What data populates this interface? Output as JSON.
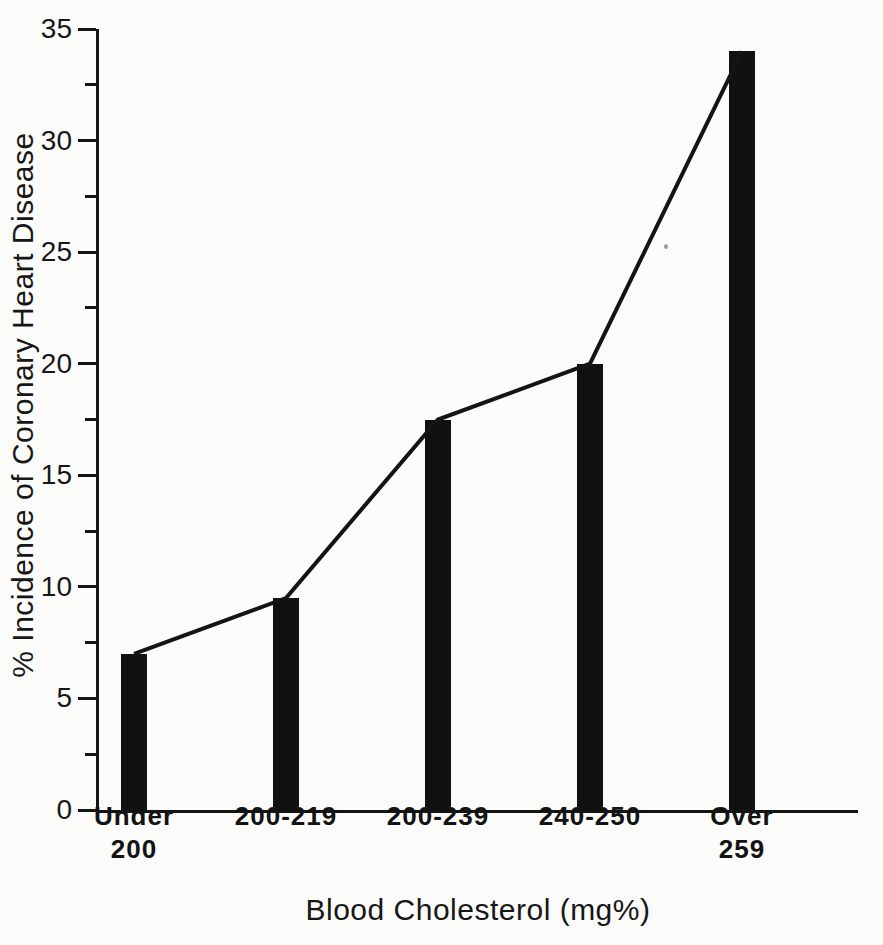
{
  "chart_data": {
    "type": "bar",
    "title": "",
    "subtitle": "",
    "xlabel": "Blood Cholesterol (mg%)",
    "ylabel": "% Incidence of Coronary Heart Disease",
    "categories": [
      "Under 200",
      "200-219",
      "200-239",
      "240-250",
      "Over 259"
    ],
    "category_lines": [
      [
        "Under",
        "200"
      ],
      [
        "200-219",
        ""
      ],
      [
        "200-239",
        ""
      ],
      [
        "240-250",
        ""
      ],
      [
        "Over",
        "259"
      ]
    ],
    "values": [
      7.0,
      9.5,
      17.5,
      20.0,
      34.0
    ],
    "series": [
      {
        "name": "% Incidence of Coronary Heart Disease",
        "values": [
          7.0,
          9.5,
          17.5,
          20.0,
          34.0
        ]
      }
    ],
    "overlay": {
      "type": "line",
      "values": [
        7.0,
        9.5,
        17.5,
        20.0,
        34.0
      ],
      "note": "polyline connecting the tops of the bars"
    },
    "ylim": [
      0,
      35
    ],
    "xlim": [
      0,
      5
    ],
    "ytick_labels": [
      "0",
      "5",
      "10",
      "15",
      "20",
      "25",
      "30",
      "35"
    ],
    "ytick_values": [
      0,
      5,
      10,
      15,
      20,
      25,
      30,
      35
    ],
    "yminor_tick_values": [
      2.5,
      7.5,
      12.5,
      17.5,
      22.5,
      27.5,
      32.5
    ],
    "grid": false,
    "legend": "none",
    "bar_color": "#111111",
    "line_color": "#141414",
    "axis_color": "#141414",
    "background_color": "#fbfbfa"
  },
  "figure": {
    "ylabel": "% Incidence of Coronary Heart Disease",
    "xlabel": "Blood Cholesterol (mg%)"
  }
}
